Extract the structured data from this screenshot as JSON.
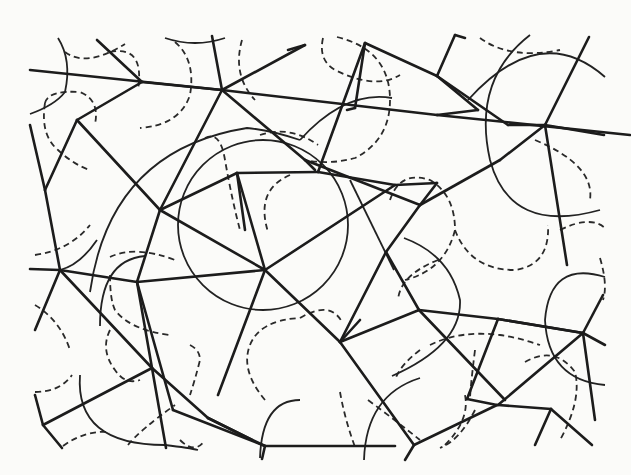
{
  "figure": {
    "colors": {
      "background": "#fbfbf9",
      "ink": "#1c1c1c"
    },
    "edges": [
      [
        30,
        70,
        222,
        90
      ],
      [
        222,
        90,
        437,
        115
      ],
      [
        437,
        115,
        630,
        135
      ],
      [
        97,
        40,
        142,
        82
      ],
      [
        142,
        82,
        222,
        90
      ],
      [
        212,
        36,
        222,
        90
      ],
      [
        222,
        90,
        305,
        45
      ],
      [
        288,
        50,
        305,
        45
      ],
      [
        222,
        90,
        305,
        160
      ],
      [
        305,
        160,
        315,
        170
      ],
      [
        142,
        82,
        77,
        120
      ],
      [
        77,
        120,
        45,
        190
      ],
      [
        30,
        125,
        45,
        190
      ],
      [
        77,
        120,
        160,
        210
      ],
      [
        160,
        210,
        222,
        90
      ],
      [
        160,
        210,
        237,
        173
      ],
      [
        237,
        173,
        318,
        172
      ],
      [
        237,
        173,
        245,
        230
      ],
      [
        318,
        172,
        365,
        43
      ],
      [
        365,
        43,
        437,
        76
      ],
      [
        437,
        76,
        478,
        110
      ],
      [
        478,
        110,
        437,
        115
      ],
      [
        365,
        43,
        355,
        108
      ],
      [
        355,
        108,
        347,
        110
      ],
      [
        437,
        76,
        455,
        35
      ],
      [
        455,
        35,
        465,
        38
      ],
      [
        437,
        76,
        508,
        125
      ],
      [
        508,
        125,
        545,
        125
      ],
      [
        545,
        125,
        589,
        37
      ],
      [
        545,
        125,
        604,
        135
      ],
      [
        545,
        125,
        567,
        265
      ],
      [
        305,
        160,
        420,
        205
      ],
      [
        420,
        205,
        500,
        160
      ],
      [
        500,
        160,
        545,
        125
      ],
      [
        420,
        205,
        437,
        183
      ],
      [
        318,
        172,
        395,
        185
      ],
      [
        395,
        185,
        437,
        183
      ],
      [
        265,
        270,
        160,
        210
      ],
      [
        265,
        270,
        237,
        173
      ],
      [
        265,
        270,
        395,
        185
      ],
      [
        265,
        270,
        218,
        395
      ],
      [
        265,
        270,
        340,
        342
      ],
      [
        265,
        270,
        137,
        282
      ],
      [
        137,
        282,
        160,
        210
      ],
      [
        137,
        282,
        173,
        410
      ],
      [
        173,
        410,
        265,
        446
      ],
      [
        340,
        342,
        386,
        252
      ],
      [
        386,
        252,
        420,
        205
      ],
      [
        340,
        342,
        419,
        310
      ],
      [
        386,
        252,
        419,
        310
      ],
      [
        419,
        310,
        505,
        400
      ],
      [
        419,
        310,
        498,
        319
      ],
      [
        498,
        319,
        467,
        399
      ],
      [
        498,
        319,
        583,
        333
      ],
      [
        583,
        333,
        605,
        345
      ],
      [
        583,
        333,
        498,
        319
      ],
      [
        583,
        333,
        498,
        405
      ],
      [
        498,
        405,
        551,
        409
      ],
      [
        551,
        409,
        592,
        445
      ],
      [
        551,
        409,
        535,
        445
      ],
      [
        583,
        333,
        603,
        295
      ],
      [
        583,
        333,
        595,
        420
      ],
      [
        467,
        399,
        497,
        405
      ],
      [
        497,
        405,
        414,
        445
      ],
      [
        414,
        445,
        340,
        342
      ],
      [
        414,
        445,
        405,
        460
      ],
      [
        265,
        446,
        262,
        459
      ],
      [
        265,
        446,
        395,
        446
      ],
      [
        340,
        342,
        360,
        320
      ],
      [
        45,
        190,
        60,
        270
      ],
      [
        30,
        269,
        60,
        270
      ],
      [
        60,
        270,
        137,
        282
      ],
      [
        60,
        270,
        35,
        330
      ],
      [
        60,
        270,
        152,
        368
      ],
      [
        152,
        368,
        208,
        418
      ],
      [
        152,
        368,
        137,
        282
      ],
      [
        152,
        368,
        43,
        425
      ],
      [
        152,
        368,
        166,
        448
      ],
      [
        43,
        425,
        35,
        395
      ],
      [
        43,
        425,
        62,
        448
      ],
      [
        208,
        418,
        252,
        440
      ],
      [
        208,
        418,
        265,
        446
      ]
    ],
    "solid_arcs": [
      "M 58 38 Q 72 60 65 92 Q 55 105 30 114",
      "M 165 38 Q 195 48 225 38",
      "M 90 292 Q 110 150 247 128 Q 270 130 300 140",
      "M 300 140 Q 345 90 392 98",
      "M 468 100 Q 540 20 605 77",
      "M 530 35 Q 472 80 490 160 Q 510 235 600 210",
      "M 60 270 Q 80 265 97 240",
      "M 178 225 A 82 82 0 1 0 348 225 A 82 82 0 1 0 178 225",
      "M 404 238 Q 450 255 460 300 Q 462 345 392 376",
      "M 394 270 Q 360 200 350 180",
      "M 605 277 Q 550 260 545 320 Q 548 380 605 385",
      "M 100 326 Q 100 260 145 256",
      "M 80 375 Q 75 445 165 445 Q 190 448 198 450",
      "M 364 460 Q 366 395 420 378",
      "M 260 458 Q 262 400 300 400"
    ],
    "dashed_arcs": [
      "M 65 52 Q 86 68 125 44",
      "M 110 52 Q 145 45 138 90",
      "M 175 42 Q 196 60 190 95 Q 180 125 140 128",
      "M 242 40 Q 232 75 255 100",
      "M 45 103 Q 48 90 80 92 Q 100 100 95 124",
      "M 45 103 Q 40 135 58 150 Q 74 165 90 170",
      "M 323 38 Q 318 60 335 70 Q 375 90 400 75",
      "M 337 37 Q 390 50 390 100 Q 390 140 355 158 Q 330 165 305 160",
      "M 480 38 Q 510 60 560 50",
      "M 205 138 Q 220 130 225 160 Q 232 200 240 230",
      "M 260 135 Q 290 125 318 145",
      "M 290 175 Q 255 190 268 232",
      "M 390 200 Q 400 170 430 180 Q 455 195 455 230 Q 445 270 405 280",
      "M 455 230 Q 470 270 515 270 Q 550 265 548 225",
      "M 560 230 Q 590 215 605 228",
      "M 535 140 Q 595 165 590 200",
      "M 35 255 Q 70 250 90 225",
      "M 35 305 Q 60 320 70 350",
      "M 110 257 Q 135 245 175 260",
      "M 110 275 Q 110 300 115 310 Q 130 330 170 335",
      "M 110 330 Q 100 350 115 370 Q 125 385 140 380",
      "M 35 392 Q 60 392 72 375",
      "M 63 446 Q 85 430 110 432",
      "M 128 445 Q 140 430 175 405",
      "M 190 345 Q 200 350 200 360 Q 195 380 190 395",
      "M 180 440 Q 195 455 205 440",
      "M 265 400 Q 240 370 250 345 Q 260 320 300 318",
      "M 300 318 Q 330 300 342 322",
      "M 340 392 Q 345 420 355 447",
      "M 368 400 Q 395 420 420 440",
      "M 445 445 Q 470 420 465 395",
      "M 430 345 Q 460 330 500 335 Q 520 338 540 345",
      "M 475 350 Q 470 390 470 400",
      "M 420 350 Q 400 365 395 380",
      "M 475 410 Q 460 440 440 448",
      "M 525 362 Q 555 345 575 372 Q 582 400 560 440",
      "M 600 258 Q 608 285 603 300",
      "M 438 260 Q 400 275 398 300"
    ]
  }
}
